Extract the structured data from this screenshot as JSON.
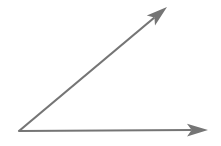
{
  "figure": {
    "background_color": "#ffffff",
    "width": 221,
    "height": 146,
    "stroke_color": "#757575",
    "stroke_color_light": "#8d8d8d",
    "shape_type": "acute-angle"
  },
  "chart_data": {
    "type": "diagram",
    "vertex": {
      "label": "vertex",
      "x": 19,
      "y": 131
    },
    "rays": [
      {
        "name": "horizontal-ray",
        "label": "Horizontal ray",
        "from": {
          "x": 19,
          "y": 131
        },
        "to": {
          "x": 208,
          "y": 130
        },
        "direction_degrees": 0,
        "length_px": 189,
        "arrowhead": "barbed",
        "stroke_width": 2.0,
        "color": "#757575"
      },
      {
        "name": "diagonal-ray",
        "label": "Diagonal ray",
        "from": {
          "x": 19,
          "y": 131
        },
        "to": {
          "x": 167,
          "y": 7
        },
        "direction_degrees": 40,
        "length_px": 193,
        "arrowhead": "barbed",
        "stroke_width": 2.2,
        "color": "#757575"
      }
    ],
    "angle": {
      "measure_degrees": 40,
      "classification": "acute",
      "between": [
        "horizontal-ray",
        "diagonal-ray"
      ]
    },
    "xlabel": "",
    "ylabel": "",
    "grid": false,
    "legend": false,
    "annotations": []
  }
}
